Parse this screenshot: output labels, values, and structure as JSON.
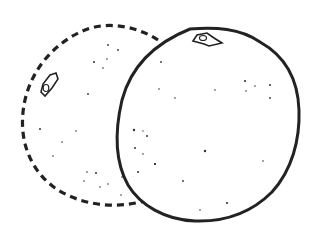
{
  "illustration": {
    "subject": "Two citrus fruits line drawing",
    "back_fruit": {
      "style": "dashed-outline",
      "stroke": "#222222"
    },
    "front_fruit": {
      "style": "solid-outline",
      "stroke": "#222222"
    },
    "background": "#ffffff"
  }
}
